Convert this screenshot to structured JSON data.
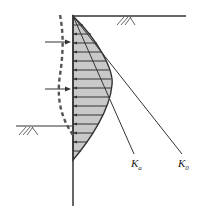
{
  "diagram": {
    "labels": {
      "ka": {
        "main": "K",
        "sub": "a"
      },
      "k0": {
        "main": "K",
        "sub": "0"
      }
    },
    "colors": {
      "line": "#333333",
      "shade": "#c9c9c9",
      "dashed": "#555555",
      "background": "#ffffff"
    },
    "elements": {
      "wall": "vertical retaining wall",
      "ground_surface_right": "ground surface (retained side)",
      "ground_surface_left": "excavation level",
      "pressure_diagram": "curved shaded earth pressure distribution with horizontal hatching",
      "deflection_curve": "dashed wall deflection curve",
      "support_arrows": 2
    }
  }
}
